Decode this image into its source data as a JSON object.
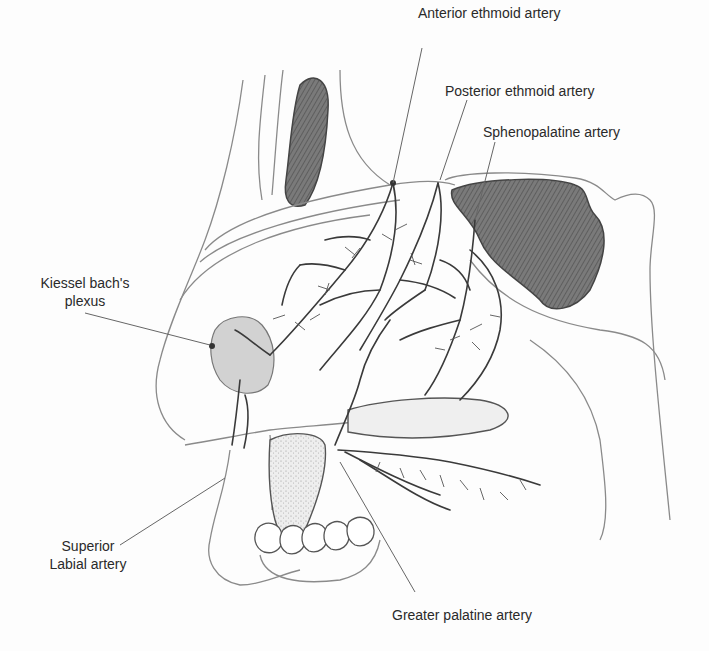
{
  "figure": {
    "labels": {
      "anterior_ethmoid": "Anterior ethmoid artery",
      "posterior_ethmoid": "Posterior ethmoid artery",
      "sphenopalatine": "Sphenopalatine artery",
      "kiesselbach_line1": "Kiessel bach's",
      "kiesselbach_line2": "plexus",
      "superior_labial_line1": "Superior",
      "superior_labial_line2": "Labial artery",
      "greater_palatine": "Greater palatine artery"
    },
    "colors": {
      "pencil": "#3a3a3a",
      "light_pencil": "#8a8a8a",
      "shade_dark": "#6b6b6b",
      "shade_light": "#c9c9c9",
      "leader": "#555555"
    }
  }
}
